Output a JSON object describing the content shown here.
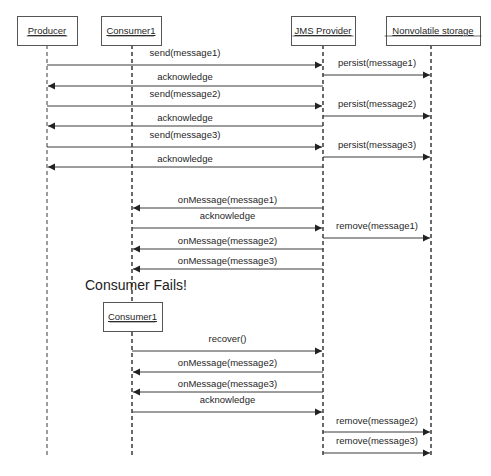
{
  "diagram": {
    "type": "sequence",
    "participants": [
      {
        "id": "producer",
        "label": "Producer",
        "x": 47,
        "box": [
          17,
          16,
          60,
          29
        ]
      },
      {
        "id": "consumer1",
        "label": "Consumer1",
        "x": 132,
        "box": [
          101,
          16,
          60,
          29
        ]
      },
      {
        "id": "jms",
        "label": "JMS Provider",
        "x": 323,
        "box": [
          291,
          16,
          64,
          29
        ]
      },
      {
        "id": "storage",
        "label": "Nonvolatile storage",
        "x": 431,
        "box": [
          386,
          16,
          94,
          29
        ]
      }
    ],
    "second_consumer": {
      "label": "Consumer1",
      "box": [
        103,
        302,
        59,
        29
      ]
    },
    "annotation": {
      "text": "Consumer Fails!",
      "x": 85,
      "y": 290
    },
    "messages": [
      {
        "label": "send(message1)",
        "from": "producer",
        "to": "jms",
        "y": 65,
        "ly": 56
      },
      {
        "label": "persist(message1)",
        "from": "jms",
        "to": "storage",
        "y": 75,
        "ly": 66
      },
      {
        "label": "acknowledge",
        "from": "jms",
        "to": "producer",
        "y": 86,
        "ly": 80
      },
      {
        "label": "send(message2)",
        "from": "producer",
        "to": "jms",
        "y": 106,
        "ly": 97
      },
      {
        "label": "persist(message2)",
        "from": "jms",
        "to": "storage",
        "y": 116,
        "ly": 107
      },
      {
        "label": "acknowledge",
        "from": "jms",
        "to": "producer",
        "y": 126,
        "ly": 121
      },
      {
        "label": "send(message3)",
        "from": "producer",
        "to": "jms",
        "y": 147,
        "ly": 138
      },
      {
        "label": "persist(message3)",
        "from": "jms",
        "to": "storage",
        "y": 157,
        "ly": 148
      },
      {
        "label": "acknowledge",
        "from": "jms",
        "to": "producer",
        "y": 167,
        "ly": 162
      },
      {
        "label": "onMessage(message1)",
        "from": "jms",
        "to": "consumer1",
        "y": 208,
        "ly": 203
      },
      {
        "label": "acknowledge",
        "from": "consumer1",
        "to": "jms",
        "y": 228,
        "ly": 219
      },
      {
        "label": "remove(message1)",
        "from": "jms",
        "to": "storage",
        "y": 238,
        "ly": 229
      },
      {
        "label": "onMessage(message2)",
        "from": "jms",
        "to": "consumer1",
        "y": 249,
        "ly": 244
      },
      {
        "label": "onMessage(message3)",
        "from": "jms",
        "to": "consumer1",
        "y": 269,
        "ly": 264
      },
      {
        "label": "recover()",
        "from": "consumer1",
        "to": "jms",
        "y": 351,
        "ly": 342
      },
      {
        "label": "onMessage(message2)",
        "from": "jms",
        "to": "consumer1",
        "y": 372,
        "ly": 366
      },
      {
        "label": "onMessage(message3)",
        "from": "jms",
        "to": "consumer1",
        "y": 392,
        "ly": 387
      },
      {
        "label": "acknowledge",
        "from": "consumer1",
        "to": "jms",
        "y": 412,
        "ly": 403
      },
      {
        "label": "remove(message2)",
        "from": "jms",
        "to": "storage",
        "y": 432,
        "ly": 424
      },
      {
        "label": "remove(message3)",
        "from": "jms",
        "to": "storage",
        "y": 453,
        "ly": 444
      }
    ],
    "lifeline_end_y": 458,
    "colors": {
      "line": "#3a3a3a",
      "box_border": "#555555",
      "text": "#1f1f1f"
    }
  }
}
